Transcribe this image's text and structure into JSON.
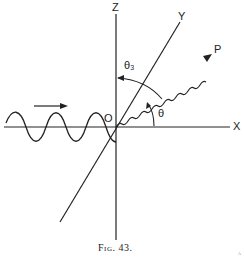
{
  "figure": {
    "caption": "Fig. 43.",
    "labels": {
      "z_axis": "Z",
      "y_axis": "Y",
      "x_axis": "X",
      "origin": "O",
      "point": "P",
      "theta": "θ",
      "theta_z": "θ₃"
    },
    "elements": {
      "incident_wave": "sinusoidal wave traveling along X toward O",
      "incident_arrow": "arrow pointing right above incident wave",
      "scattered_ray": "wavy line from O to P",
      "angle_theta": "arc from X axis to OP",
      "angle_theta_z": "arc from OP toward Z axis"
    },
    "page_mark": "a"
  }
}
